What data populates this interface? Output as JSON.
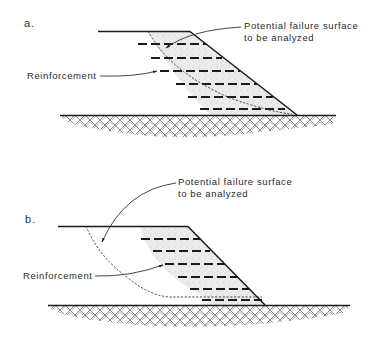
{
  "figure": {
    "panels": [
      {
        "id": "a",
        "label": "a.",
        "failure_label_line1": "Potential failure surface",
        "failure_label_line2": "to be analyzed",
        "reinforcement_label": "Reinforcement",
        "reinforcement_layers": 6,
        "failure_surface": "passes through reinforced zone"
      },
      {
        "id": "b",
        "label": "b.",
        "failure_label_line1": "Potential failure surface",
        "failure_label_line2": "to be analyzed",
        "reinforcement_label": "Reinforcement",
        "reinforcement_layers": 6,
        "failure_surface": "passes behind and beneath reinforced zone"
      }
    ],
    "colors": {
      "line": "#1a1a1a",
      "fill_stipple": "#e6e6e6",
      "background": "#ffffff"
    }
  }
}
